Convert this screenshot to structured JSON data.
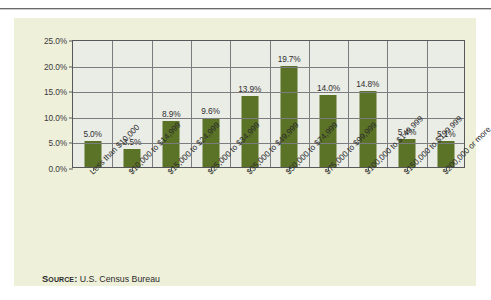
{
  "page": {
    "background_color": "#ffffff",
    "panel_color": "#eef0da",
    "rule_color": "#6b6b6b"
  },
  "source": {
    "key_label": "Source:",
    "value": "U.S. Census Bureau"
  },
  "chart_data": {
    "type": "bar",
    "title": "",
    "subtitle": "",
    "xlabel": "",
    "ylabel": "",
    "ylim": [
      0,
      25
    ],
    "ytick_labels": [
      "0.0%",
      "5.0%",
      "10.0%",
      "15.0%",
      "20.0%",
      "25.0%"
    ],
    "ytick_values": [
      0,
      5,
      10,
      15,
      20,
      25
    ],
    "grid": true,
    "legend": "none",
    "bar_color": "#5b7326",
    "plot_bg_color": "#eaece6",
    "axis_color": "#58585a",
    "categories": [
      "Less than $10,000",
      "$10,000 to $14,999",
      "$15,000 to $24,999",
      "$25,000 to $34,999",
      "$35,000 to $49,999",
      "$50,000 to $74,999",
      "$75,000 to $99,999",
      "$100,000 to $149,999",
      "$150,000 to $199,999",
      "$200,000 or more"
    ],
    "values": [
      5.0,
      3.5,
      8.9,
      9.6,
      13.9,
      19.7,
      14.0,
      14.8,
      5.4,
      5.1
    ],
    "data_labels": [
      "5.0%",
      "3.5%",
      "8.9%",
      "9.6%",
      "13.9%",
      "19.7%",
      "14.0%",
      "14.8%",
      "5.4%",
      "5.1%"
    ]
  }
}
